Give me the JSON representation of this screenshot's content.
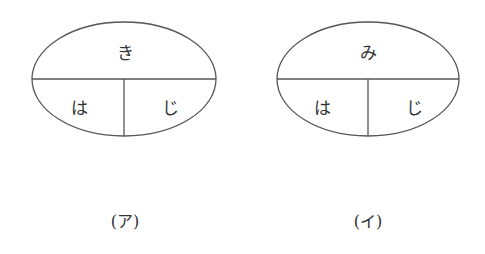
{
  "diagrams": [
    {
      "top": "き",
      "bottom_left": "は",
      "bottom_right": "じ",
      "caption": "(ア)"
    },
    {
      "top": "み",
      "bottom_left": "は",
      "bottom_right": "じ",
      "caption": "(イ)"
    }
  ],
  "colors": {
    "stroke": "#555555",
    "text": "#333333"
  }
}
